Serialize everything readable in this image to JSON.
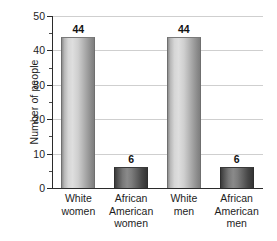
{
  "chart_data": {
    "type": "bar",
    "title": "",
    "subtitle": "",
    "xlabel": "",
    "ylabel": "Number of people",
    "ylim": [
      0,
      50
    ],
    "ymajor_step": 10,
    "yminor_step": 5,
    "grid": "horizontal",
    "legend": "none",
    "categories": [
      "White women",
      "African American women",
      "White men",
      "African American men"
    ],
    "category_lines": [
      [
        "White",
        "women"
      ],
      [
        "African",
        "American",
        "women"
      ],
      [
        "White",
        "men"
      ],
      [
        "African",
        "American",
        "men"
      ]
    ],
    "values": [
      44,
      6,
      44,
      6
    ],
    "value_labels": [
      "44",
      "6",
      "44",
      "6"
    ],
    "ytick_labels": [
      "0",
      "10",
      "20",
      "30",
      "40",
      "50"
    ],
    "ytick_values": [
      0,
      10,
      20,
      30,
      40,
      50
    ],
    "bar_styles": [
      "light-cylinder",
      "dark-cylinder",
      "light-cylinder",
      "dark-cylinder"
    ],
    "colors": {
      "bar_light_mid": "#dedede",
      "bar_light_edge": "#7e7e7e",
      "bar_dark_mid": "#8a8a8a",
      "bar_dark_edge": "#343434",
      "axis": "#2b2b2b",
      "gridline": "#cfcfcf",
      "text": "#1d1d1d",
      "background": "#ffffff"
    }
  }
}
